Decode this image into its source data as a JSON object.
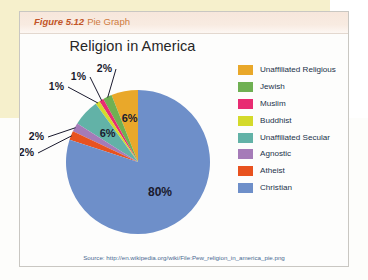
{
  "figure": {
    "number": "Figure 5.12",
    "type_label": "Pie Graph"
  },
  "chart_title": "Religion in America",
  "source": "Source: http://en.wikipedia.org/wiki/File:Pew_religion_in_america_pie.png",
  "colors": {
    "unaffiliated_religious": "#e8a723",
    "jewish": "#6cb24f",
    "muslim": "#e8236e",
    "buddhist": "#d6dc2a",
    "unaffiliated_secular": "#63b3a8",
    "agnostic": "#a濃"
  },
  "chart_data": {
    "type": "pie",
    "title": "Religion in America",
    "legend_position": "right",
    "categories": [
      "Unaffiliated Religious",
      "Jewish",
      "Muslim",
      "Buddhist",
      "Unaffiliated Secular",
      "Agnostic",
      "Atheist",
      "Christian"
    ],
    "values": [
      6,
      2,
      1,
      1,
      6,
      2,
      2,
      80
    ],
    "value_labels": [
      "6%",
      "2%",
      "1%",
      "1%",
      "6%",
      "2%",
      "2%",
      "80%"
    ],
    "colors": [
      "#e9a82a",
      "#6fb052",
      "#e82c72",
      "#d4da2b",
      "#62b2a7",
      "#a museum"
    ]
  },
  "legend": [
    {
      "label": "Unaffiliated Religious",
      "color": "#e9a82a"
    },
    {
      "label": "Jewish",
      "color": "#6fb052"
    },
    {
      "label": "Muslim",
      "color": "#e82c72"
    },
    {
      "label": "Buddhist",
      "color": "#d4da2b"
    },
    {
      "label": "Unaffiliated Secular",
      "color": "#62b2a7"
    },
    {
      "label": "Agnostic",
      "color": "#a濃"
    },
    {
      "label": "Atheist",
      "color": "#e8521f"
    },
    {
      "label": "Christian",
      "color": "#6e8fc9"
    }
  ]
}
